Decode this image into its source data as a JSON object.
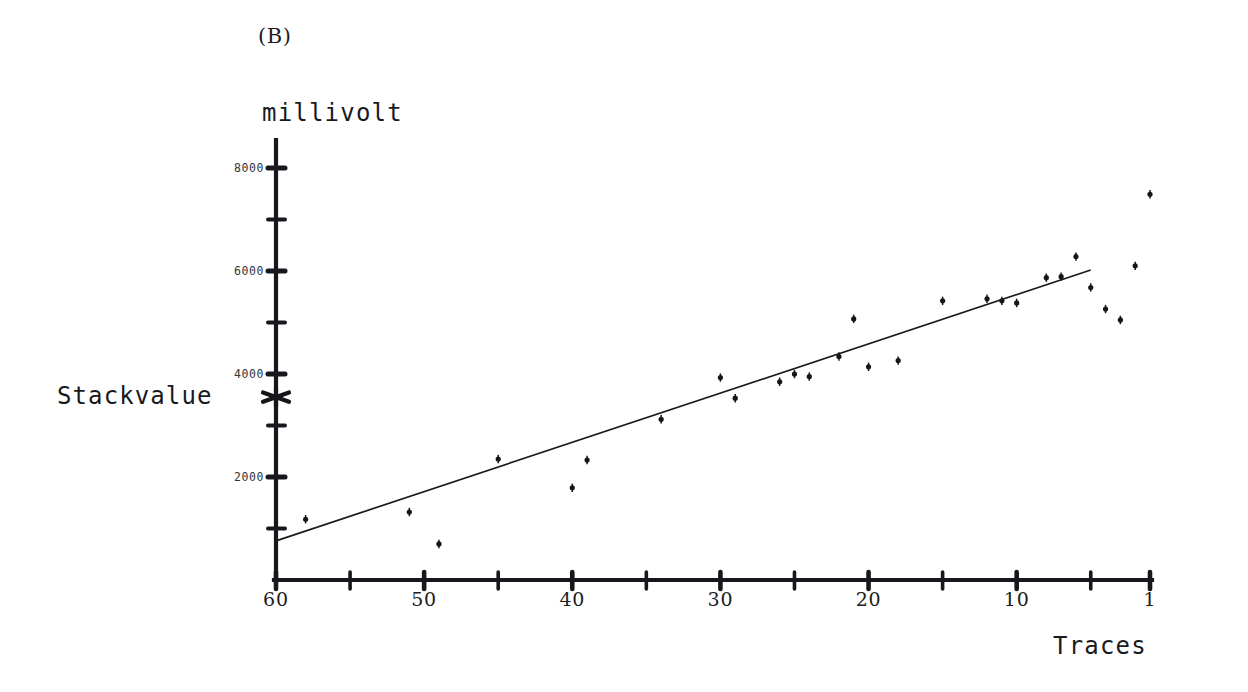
{
  "figure": {
    "panel_label": "(B)",
    "stackvalue_label": "Stackvalue",
    "marker_icon": "star-marker-icon"
  },
  "chart_data": {
    "type": "scatter",
    "title": "(B)",
    "xlabel": "Traces",
    "ylabel": "millivolt",
    "x_axis_reversed": true,
    "xlim": [
      60,
      1
    ],
    "ylim": [
      0,
      8400
    ],
    "grid": false,
    "legend": "none",
    "x_major_ticks": [
      60,
      50,
      40,
      30,
      20,
      10,
      1
    ],
    "x_major_tick_labels": [
      "60",
      "50",
      "40",
      "30",
      "20",
      "10",
      "1"
    ],
    "x_minor_tick_step": 5,
    "y_major_ticks": [
      2000,
      4000,
      6000,
      8000
    ],
    "y_major_tick_labels": [
      "2000",
      "4000",
      "6000",
      "8000"
    ],
    "y_minor_tick_step": 1000,
    "annotations": [
      {
        "name": "stackvalue-marker",
        "label": "Stackvalue",
        "x": 60,
        "y": 3550,
        "marker": "star"
      }
    ],
    "series": [
      {
        "name": "measured-amplitude",
        "marker": "dot",
        "points": [
          {
            "x": 58,
            "y": 1180
          },
          {
            "x": 51,
            "y": 1320
          },
          {
            "x": 49,
            "y": 700
          },
          {
            "x": 45,
            "y": 2350
          },
          {
            "x": 40,
            "y": 1790
          },
          {
            "x": 39,
            "y": 2330
          },
          {
            "x": 34,
            "y": 3120
          },
          {
            "x": 30,
            "y": 3930
          },
          {
            "x": 29,
            "y": 3530
          },
          {
            "x": 26,
            "y": 3850
          },
          {
            "x": 25,
            "y": 4000
          },
          {
            "x": 24,
            "y": 3950
          },
          {
            "x": 22,
            "y": 4340
          },
          {
            "x": 21,
            "y": 5070
          },
          {
            "x": 20,
            "y": 4140
          },
          {
            "x": 18,
            "y": 4260
          },
          {
            "x": 15,
            "y": 5420
          },
          {
            "x": 12,
            "y": 5460
          },
          {
            "x": 11,
            "y": 5420
          },
          {
            "x": 10,
            "y": 5380
          },
          {
            "x": 8,
            "y": 5870
          },
          {
            "x": 7,
            "y": 5890
          },
          {
            "x": 6,
            "y": 6280
          },
          {
            "x": 5,
            "y": 5680
          },
          {
            "x": 4,
            "y": 5260
          },
          {
            "x": 3,
            "y": 5050
          },
          {
            "x": 2,
            "y": 6100
          },
          {
            "x": 1,
            "y": 7490
          }
        ]
      }
    ],
    "fit_line": {
      "name": "linear-regression-line",
      "start": {
        "x": 60,
        "y": 760
      },
      "end": {
        "x": 5,
        "y": 6020
      }
    }
  }
}
